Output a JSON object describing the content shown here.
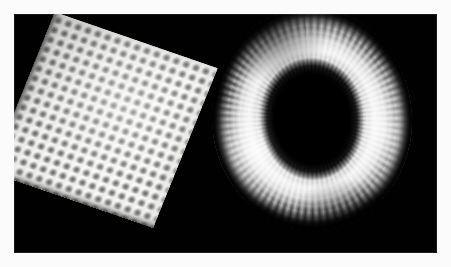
{
  "figure": {
    "background_color": "#fbfbfb",
    "canvas_color": "#010101",
    "border": {
      "left": 14,
      "top": 14,
      "right": 14,
      "bottom": 14,
      "color": "#fbfbfb"
    }
  },
  "objects": [
    {
      "name": "bump-mapped-plane",
      "label": "Bump-mapped square plane",
      "shape": "square",
      "surface": "dimple grid",
      "rotation_deg": 19,
      "bump_cell_px": 10.4,
      "base_color": "#f2f2f0",
      "highlight_color": "#ffffff",
      "shadow_color": "#3c3c3a",
      "corners": {
        "top": "155,46",
        "left": "33,96",
        "right": "202,178",
        "bottom": "92,235"
      }
    },
    {
      "name": "bump-mapped-torus",
      "label": "Bump-mapped torus",
      "shape": "torus",
      "surface": "radial ribbed corrugation",
      "rotation_deg": -4,
      "rib_period_deg": 4.4,
      "highlight_color": "#f4f4f4",
      "midtone_color": "#8e8e8e",
      "shadow_color": "#000000",
      "bounds": {
        "left": 228,
        "top": 25,
        "right": 425,
        "bottom": 243
      },
      "hole": {
        "center_x": 330,
        "center_y": 132,
        "width": 104,
        "height": 124
      }
    }
  ],
  "lighting": {
    "key_light": "upper-right",
    "ambient": "low",
    "background": "#000000"
  }
}
